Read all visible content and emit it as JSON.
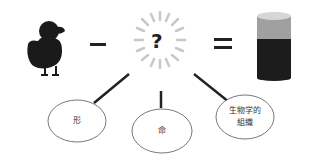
{
  "diagram": {
    "equation": {
      "left_item": "duck-silhouette",
      "operator_minus": "−",
      "unknown": "?",
      "operator_equals": "=",
      "right_item": "cylinder-container"
    },
    "nodes": [
      {
        "id": "shape",
        "label": "形"
      },
      {
        "id": "life",
        "label": "命"
      },
      {
        "id": "bio_tissue",
        "label_line1": "生物学的",
        "label_line2": "組織"
      }
    ],
    "colors": {
      "duck": "#1a1a1a",
      "burst": "#c8c8c8",
      "connector": "#222222",
      "cylinder_top": "#d6d6d6",
      "cylinder_mid": "#a0a0a0",
      "cylinder_bottom": "#1c1c1c",
      "ellipse_stroke": "#555555"
    }
  }
}
